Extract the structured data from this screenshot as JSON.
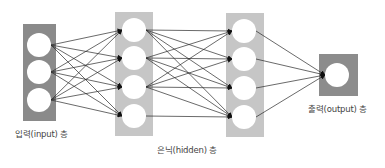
{
  "diagram": {
    "colors": {
      "background": "#ffffff",
      "input_box": "#8a8a8a",
      "hidden_box": "#c6c6c6",
      "output_box": "#8c8c8c",
      "neuron": "#ffffff",
      "edge": "#2a2a2a"
    },
    "layers": [
      {
        "id": "input",
        "label": "입력(input) 층",
        "box": {
          "x": 23,
          "y": 24,
          "w": 33,
          "h": 97
        },
        "color_key": "input_box",
        "neurons": [
          {
            "cx": 39,
            "cy": 45
          },
          {
            "cx": 39,
            "cy": 72
          },
          {
            "cx": 39,
            "cy": 100
          }
        ],
        "r": 12,
        "label_pos": {
          "x": 15,
          "y": 127
        }
      },
      {
        "id": "hidden1",
        "label": "",
        "box": {
          "x": 115,
          "y": 12,
          "w": 38,
          "h": 124
        },
        "color_key": "hidden_box",
        "neurons": [
          {
            "cx": 134,
            "cy": 30
          },
          {
            "cx": 134,
            "cy": 58
          },
          {
            "cx": 134,
            "cy": 87
          },
          {
            "cx": 134,
            "cy": 116
          }
        ],
        "r": 12
      },
      {
        "id": "hidden2",
        "label": "",
        "box": {
          "x": 226,
          "y": 13,
          "w": 38,
          "h": 124
        },
        "color_key": "hidden_box",
        "neurons": [
          {
            "cx": 244,
            "cy": 31
          },
          {
            "cx": 244,
            "cy": 59
          },
          {
            "cx": 244,
            "cy": 88
          },
          {
            "cx": 244,
            "cy": 117
          }
        ],
        "r": 12
      },
      {
        "id": "output",
        "label": "출력(output) 층",
        "box": {
          "x": 319,
          "y": 54,
          "w": 39,
          "h": 42
        },
        "color_key": "output_box",
        "neurons": [
          {
            "cx": 337,
            "cy": 75
          }
        ],
        "r": 12,
        "label_pos": {
          "x": 308,
          "y": 102
        }
      }
    ],
    "hidden_label": {
      "text": "은닉(hidden) 층",
      "x": 157,
      "y": 143
    },
    "connections": [
      {
        "from": "input",
        "to": "hidden1",
        "pairs": "all"
      },
      {
        "from": "hidden1",
        "to": "hidden2",
        "pairs": [
          [
            0,
            0
          ],
          [
            0,
            1
          ],
          [
            0,
            2
          ],
          [
            0,
            3
          ],
          [
            1,
            0
          ],
          [
            1,
            1
          ],
          [
            1,
            2
          ],
          [
            1,
            3
          ],
          [
            2,
            0
          ],
          [
            2,
            1
          ],
          [
            2,
            2
          ],
          [
            2,
            3
          ],
          [
            3,
            3
          ]
        ]
      },
      {
        "from": "hidden2",
        "to": "output",
        "pairs": "all"
      }
    ]
  }
}
